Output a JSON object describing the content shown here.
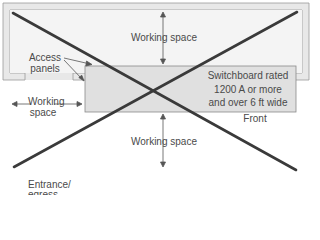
{
  "diagram": {
    "labels": {
      "working_space_top": "Working space",
      "working_space_bottom": "Working space",
      "working_space_left_1": "Working",
      "working_space_left_2": "space",
      "access_panels_1": "Access",
      "access_panels_2": "panels",
      "switchboard_1": "Switchboard rated",
      "switchboard_2": "1200 A or more",
      "switchboard_3": "and over 6 ft wide",
      "front": "Front",
      "entrance_1": "Entrance/",
      "entrance_2": "egress"
    },
    "colors": {
      "wall_fill": "#e8e8e8",
      "wall_stroke": "#9a9a9a",
      "room_fill": "#f4f4f4",
      "switchboard_fill": "#e0e0e0",
      "cross_lines": "#3a3a3a",
      "text": "#4a4a4a"
    }
  }
}
